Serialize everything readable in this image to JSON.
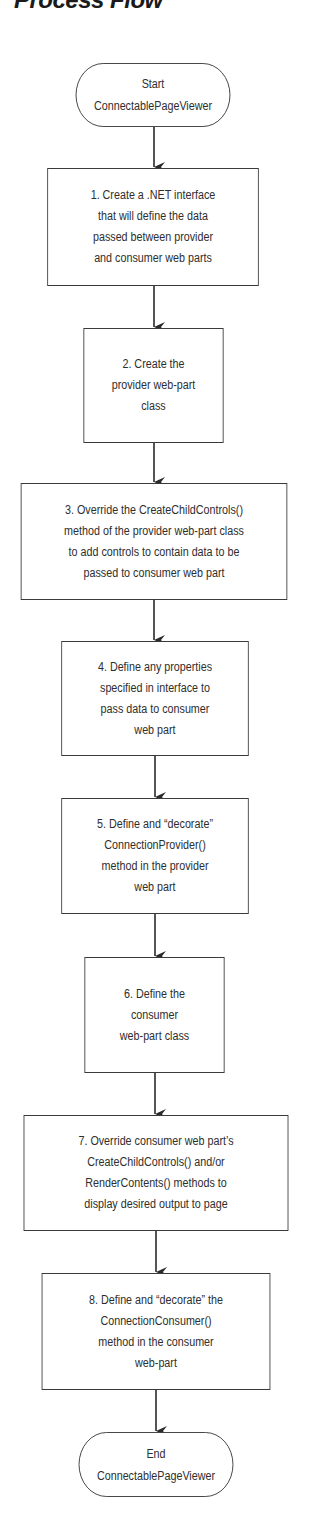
{
  "title": "Process Flow",
  "colors": {
    "stroke": "#3a3a3a",
    "text": "#2e2e2e",
    "background": "#ffffff"
  },
  "flowchart": {
    "start": {
      "type": "terminal",
      "label": "Start\nConnectablePageViewer"
    },
    "steps": [
      {
        "number": 1,
        "label": "1. Create a .NET interface\nthat will define the data\npassed between provider\nand consumer web parts"
      },
      {
        "number": 2,
        "label": "2. Create the\nprovider web-part\nclass"
      },
      {
        "number": 3,
        "label": "3. Override the CreateChildControls()\nmethod of the provider web-part class\nto add controls to contain data to be\npassed to consumer web part"
      },
      {
        "number": 4,
        "label": "4. Define any properties\nspecified in interface to\npass data to consumer\nweb part"
      },
      {
        "number": 5,
        "label": "5. Define and “decorate”\nConnectionProvider()\nmethod in the provider\nweb part"
      },
      {
        "number": 6,
        "label": "6. Define the\nconsumer\nweb-part class"
      },
      {
        "number": 7,
        "label": "7. Override consumer web part’s\nCreateChildControls() and/or\nRenderContents() methods to\ndisplay desired output to page"
      },
      {
        "number": 8,
        "label": "8. Define and “decorate” the\nConnectionConsumer()\nmethod in the consumer\nweb-part"
      }
    ],
    "end": {
      "type": "terminal",
      "label": "End\nConnectablePageViewer"
    },
    "edges": [
      {
        "from": "start",
        "to": "step-1"
      },
      {
        "from": "step-1",
        "to": "step-2"
      },
      {
        "from": "step-2",
        "to": "step-3"
      },
      {
        "from": "step-3",
        "to": "step-4"
      },
      {
        "from": "step-4",
        "to": "step-5"
      },
      {
        "from": "step-5",
        "to": "step-6"
      },
      {
        "from": "step-6",
        "to": "step-7"
      },
      {
        "from": "step-7",
        "to": "step-8"
      },
      {
        "from": "step-8",
        "to": "end"
      }
    ]
  }
}
